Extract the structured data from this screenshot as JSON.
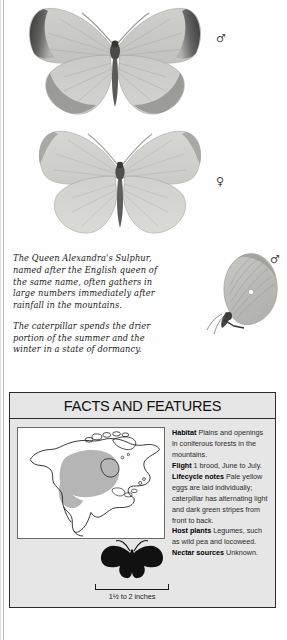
{
  "page": {
    "caption_paragraphs": [
      "The Queen Alexandra's Sulphur, named after the English queen of the same name, often gathers in large numbers immediately after rainfall in the mountains.",
      "The caterpillar spends the drier portion of the summer and the winter in a state of dormancy."
    ]
  },
  "specimens": [
    {
      "name": "male-dorsal",
      "sex_symbol": "♂",
      "sex": "male",
      "view": "dorsal"
    },
    {
      "name": "female-dorsal",
      "sex_symbol": "♀",
      "sex": "female",
      "view": "dorsal"
    },
    {
      "name": "male-ventral",
      "sex_symbol": "♂",
      "sex": "male",
      "view": "ventral"
    }
  ],
  "facts": {
    "title": "FACTS AND FEATURES",
    "entries": [
      {
        "label": "Habitat",
        "value": "Plains and openings in coniferous forests in the mountains."
      },
      {
        "label": "Flight",
        "value": "1 brood, June to July."
      },
      {
        "label": "Lifecycle notes",
        "value": "Pale yellow eggs are laid individually; caterpillar has alternating light and dark green stripes from front to back."
      },
      {
        "label": "Host plants",
        "value": "Legumes, such as wild pea and locoweed."
      },
      {
        "label": "Nectar sources",
        "value": "Unknown."
      }
    ],
    "size_label": "1½ to 2 inches",
    "map_caption": "North America range map"
  },
  "colors": {
    "panel_bg": "#e6e6e6",
    "panel_border": "#2b2b2b",
    "map_bg": "#ffffff",
    "range_shade": "#b5b5b5",
    "silhouette": "#111111",
    "text": "#2a2a2a"
  }
}
